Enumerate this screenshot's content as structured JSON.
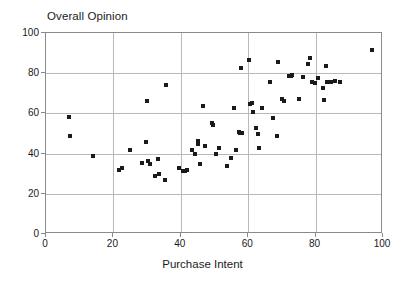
{
  "chart_data": {
    "type": "scatter",
    "title": "Overall Opinion",
    "xlabel": "Purchase Intent",
    "ylabel": "",
    "xlim": [
      0,
      100
    ],
    "ylim": [
      0,
      100
    ],
    "xticks": [
      0,
      20,
      40,
      60,
      80,
      100
    ],
    "yticks": [
      0,
      20,
      40,
      60,
      80,
      100
    ],
    "grid": true,
    "legend": "none",
    "marker": "filled-square",
    "marker_color": "#1a1a1a",
    "series": [
      {
        "name": "respondents",
        "points": [
          [
            6.8,
            58.2
          ],
          [
            7.0,
            48.8
          ],
          [
            14.0,
            39.0
          ],
          [
            21.8,
            32.0
          ],
          [
            22.5,
            32.8
          ],
          [
            25.0,
            42.0
          ],
          [
            28.4,
            35.2
          ],
          [
            29.6,
            45.7
          ],
          [
            29.9,
            66.0
          ],
          [
            30.4,
            36.3
          ],
          [
            31.0,
            34.6
          ],
          [
            32.2,
            28.8
          ],
          [
            33.2,
            37.2
          ],
          [
            33.6,
            29.9
          ],
          [
            35.3,
            27.0
          ],
          [
            35.6,
            73.9
          ],
          [
            39.5,
            32.7
          ],
          [
            40.6,
            31.3
          ],
          [
            41.2,
            31.1
          ],
          [
            41.8,
            31.6
          ],
          [
            43.2,
            41.7
          ],
          [
            44.2,
            40.0
          ],
          [
            45.0,
            46.2
          ],
          [
            45.2,
            44.8
          ],
          [
            45.6,
            34.9
          ],
          [
            46.6,
            63.9
          ],
          [
            47.2,
            43.6
          ],
          [
            49.4,
            55.0
          ],
          [
            49.6,
            54.0
          ],
          [
            50.4,
            39.9
          ],
          [
            51.4,
            42.6
          ],
          [
            53.8,
            34.0
          ],
          [
            55.0,
            37.9
          ],
          [
            55.8,
            62.6
          ],
          [
            56.4,
            41.6
          ],
          [
            57.3,
            50.9
          ],
          [
            57.6,
            50.4
          ],
          [
            57.8,
            82.5
          ],
          [
            58.2,
            50.2
          ],
          [
            60.2,
            86.8
          ],
          [
            60.6,
            64.5
          ],
          [
            61.2,
            65.3
          ],
          [
            61.4,
            60.8
          ],
          [
            62.4,
            52.8
          ],
          [
            62.8,
            49.9
          ],
          [
            63.2,
            42.8
          ],
          [
            64.2,
            62.6
          ],
          [
            66.6,
            75.4
          ],
          [
            67.4,
            57.8
          ],
          [
            68.4,
            48.6
          ],
          [
            68.8,
            85.6
          ],
          [
            70.0,
            67.0
          ],
          [
            70.6,
            66.4
          ],
          [
            72.0,
            78.8
          ],
          [
            72.6,
            78.4
          ],
          [
            73.0,
            79.2
          ],
          [
            75.0,
            67.4
          ],
          [
            76.4,
            78.0
          ],
          [
            77.6,
            84.7
          ],
          [
            78.4,
            87.6
          ],
          [
            78.8,
            75.4
          ],
          [
            79.8,
            75.3
          ],
          [
            80.6,
            77.6
          ],
          [
            82.2,
            72.4
          ],
          [
            82.6,
            66.6
          ],
          [
            83.0,
            83.4
          ],
          [
            83.4,
            75.6
          ],
          [
            84.6,
            75.4
          ],
          [
            85.8,
            76.0
          ],
          [
            87.2,
            75.4
          ],
          [
            96.8,
            91.6
          ]
        ]
      }
    ]
  },
  "axis": {
    "x_tick_labels": [
      "0",
      "20",
      "40",
      "60",
      "80",
      "100"
    ],
    "y_tick_labels": [
      "0",
      "20",
      "40",
      "60",
      "80",
      "100"
    ]
  }
}
